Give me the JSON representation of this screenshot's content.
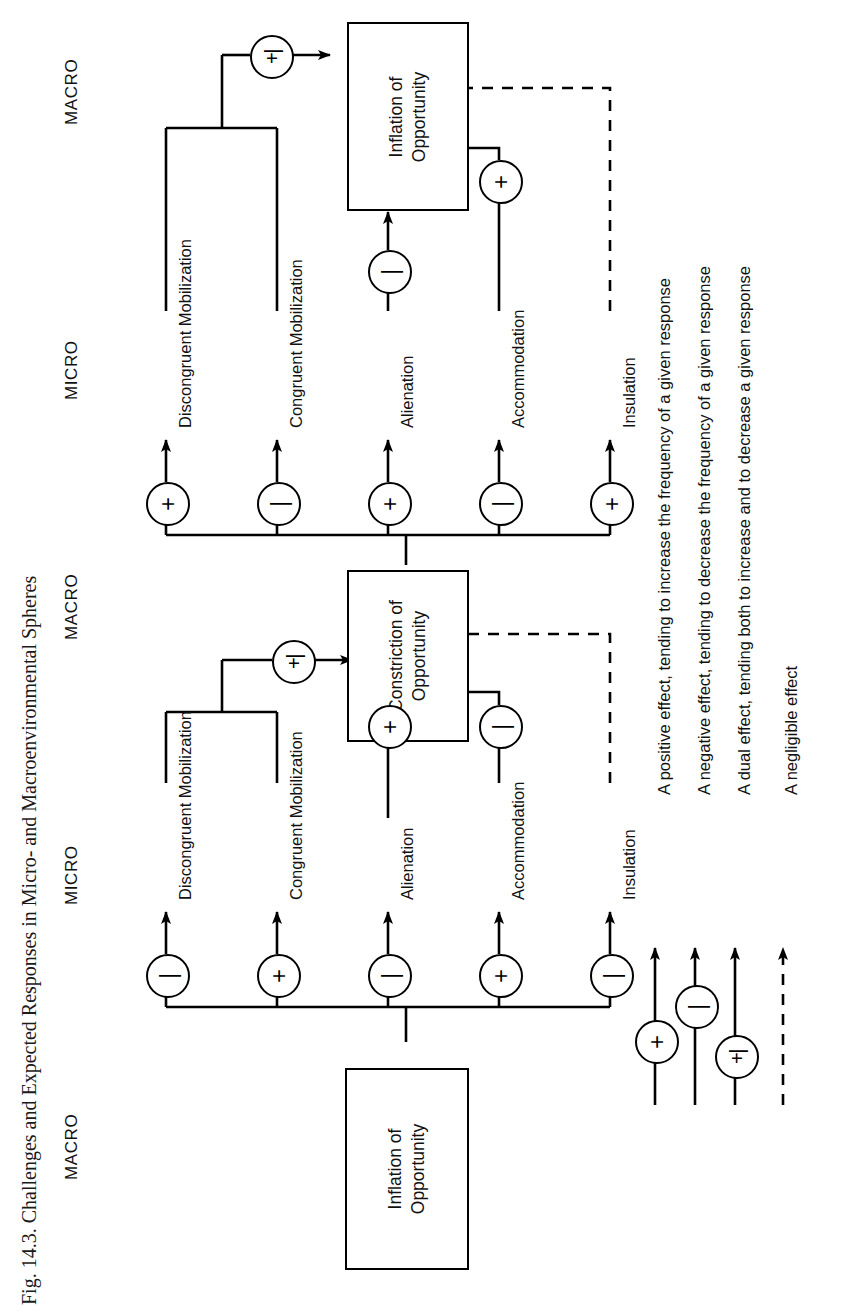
{
  "figure": {
    "caption": "Fig. 14.3.  Challenges and Expected Responses in Micro- and Macroenvironmental Spheres"
  },
  "columns": [
    {
      "id": "macro-left",
      "label": "MACRO"
    },
    {
      "id": "micro-left",
      "label": "MICRO"
    },
    {
      "id": "macro-mid",
      "label": "MACRO"
    },
    {
      "id": "micro-right",
      "label": "MICRO"
    },
    {
      "id": "macro-right",
      "label": "MACRO"
    }
  ],
  "boxes": {
    "inflation_left": {
      "line1": "Inflation of",
      "line2": "Opportunity"
    },
    "constriction_mid": {
      "line1": "Constriction of",
      "line2": "Opportunity"
    },
    "inflation_right": {
      "line1": "Inflation of",
      "line2": "Opportunity"
    }
  },
  "responses": {
    "discongruent": "Discongruent Mobilization",
    "congruent": "Congruent Mobilization",
    "alienation": "Alienation",
    "accommodation": "Accommodation",
    "insulation": "Insulation"
  },
  "signs": {
    "plus": "+",
    "minus": "|",
    "dual": "+|"
  },
  "group1": {
    "source_box": "inflation_left",
    "effects": [
      {
        "target": "discongruent",
        "sign": "minus"
      },
      {
        "target": "congruent",
        "sign": "plus"
      },
      {
        "target": "alienation",
        "sign": "minus"
      },
      {
        "target": "accommodation",
        "sign": "plus"
      },
      {
        "target": "insulation",
        "sign": "minus"
      }
    ]
  },
  "group1_outcome": {
    "target_box": "constriction_mid",
    "inputs": [
      {
        "from": "mobilization-merge",
        "sign": "dual",
        "style": "solid"
      },
      {
        "from": "alienation",
        "sign": "plus",
        "style": "solid"
      },
      {
        "from": "accommodation",
        "sign": "minus",
        "style": "solid"
      },
      {
        "from": "insulation",
        "sign": "none",
        "style": "dashed"
      }
    ]
  },
  "group2": {
    "source_box": "constriction_mid",
    "effects": [
      {
        "target": "discongruent",
        "sign": "plus"
      },
      {
        "target": "congruent",
        "sign": "minus"
      },
      {
        "target": "alienation",
        "sign": "plus"
      },
      {
        "target": "accommodation",
        "sign": "minus"
      },
      {
        "target": "insulation",
        "sign": "plus"
      }
    ]
  },
  "group2_outcome": {
    "target_box": "inflation_right",
    "inputs": [
      {
        "from": "mobilization-merge",
        "sign": "dual",
        "style": "solid"
      },
      {
        "from": "alienation",
        "sign": "minus",
        "style": "solid"
      },
      {
        "from": "accommodation",
        "sign": "plus",
        "style": "solid"
      },
      {
        "from": "insulation",
        "sign": "none",
        "style": "dashed"
      }
    ]
  },
  "legend": {
    "items": [
      {
        "symbol": "plus",
        "text": "A positive effect, tending to increase the frequency of a given response"
      },
      {
        "symbol": "minus",
        "text": "A negative effect, tending to decrease the frequency of a given response"
      },
      {
        "symbol": "dual",
        "text": "A dual effect, tending both to increase and to decrease a given response"
      },
      {
        "symbol": "dashed",
        "text": "A negligible effect"
      }
    ]
  }
}
